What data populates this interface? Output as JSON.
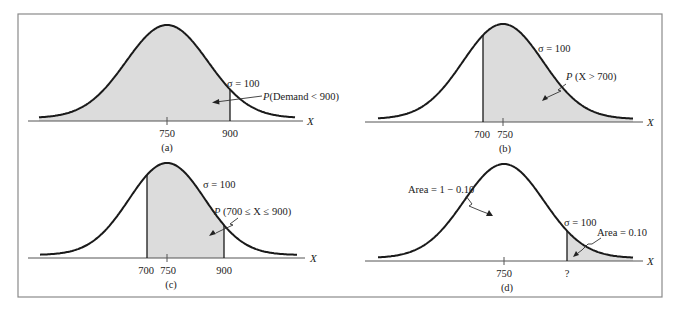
{
  "figure": {
    "border_color": "#8a8a8a",
    "curve_color": "#1a1a1a",
    "shade_color": "#dcdcdc",
    "axis_label": "X"
  },
  "chart_data": [
    {
      "type": "area",
      "panel": "(a)",
      "distribution": "normal",
      "mean": 750,
      "sigma": 100,
      "sigma_label": "σ = 100",
      "tick_labels": [
        "750",
        "900"
      ],
      "shaded_region": {
        "from": "-inf",
        "to": 900
      },
      "annotation": "P(Demand < 900)",
      "xlabel": "X",
      "caption": "(a)"
    },
    {
      "type": "area",
      "panel": "(b)",
      "distribution": "normal",
      "mean": 750,
      "sigma": 100,
      "sigma_label": "σ = 100",
      "tick_labels": [
        "700",
        "750"
      ],
      "shaded_region": {
        "from": 700,
        "to": "inf"
      },
      "annotation": "P (X > 700)",
      "xlabel": "X",
      "caption": "(b)"
    },
    {
      "type": "area",
      "panel": "(c)",
      "distribution": "normal",
      "mean": 750,
      "sigma": 100,
      "sigma_label": "σ = 100",
      "tick_labels": [
        "700",
        "750",
        "900"
      ],
      "shaded_region": {
        "from": 700,
        "to": 900
      },
      "annotation": "P (700 ≤ X ≤ 900)",
      "xlabel": "X",
      "caption": "(c)"
    },
    {
      "type": "area",
      "panel": "(d)",
      "distribution": "normal",
      "mean": 750,
      "sigma": 100,
      "sigma_label": "σ = 100",
      "tick_labels": [
        "750",
        "?"
      ],
      "shaded_region": {
        "from": "?",
        "to": "inf"
      },
      "annotations": [
        "Area = 1 − 0.10",
        "Area = 0.10"
      ],
      "xlabel": "X",
      "caption": "(d)"
    }
  ],
  "panels": {
    "a": {
      "sigma": "σ = 100",
      "annotation_prefix": "P",
      "annotation_body": "(Demand < 900)",
      "tick_mean": "750",
      "tick_bound": "900",
      "x_label": "X",
      "caption": "(a)"
    },
    "b": {
      "sigma": "σ = 100",
      "annotation_prefix": "P",
      "annotation_body": " (X > 700)",
      "tick_bound": "700",
      "tick_mean": "750",
      "x_label": "X",
      "caption": "(b)"
    },
    "c": {
      "sigma": "σ = 100",
      "annotation_prefix": "P",
      "annotation_body": " (700 ≤ X ≤ 900)",
      "tick_low": "700",
      "tick_mean": "750",
      "tick_high": "900",
      "x_label": "X",
      "caption": "(c)"
    },
    "d": {
      "sigma": "σ = 100",
      "area_main": "Area = 1 − 0.10",
      "area_tail": "Area = 0.10",
      "tick_mean": "750",
      "tick_unknown": "?",
      "x_label": "X",
      "caption": "(d)"
    }
  }
}
